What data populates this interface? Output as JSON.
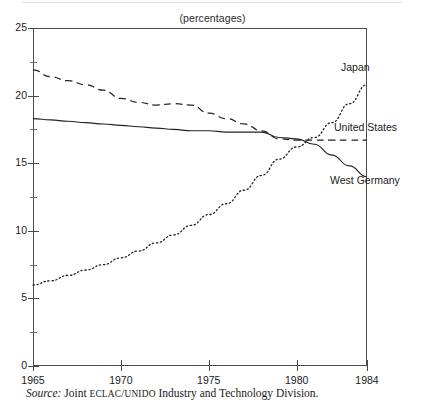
{
  "unit_note": "(percentages)",
  "source": {
    "prefix": "Source:",
    "lead": "Joint",
    "org1": "ECLAC",
    "separator": "/",
    "org2": "UNIDO",
    "tail": "Industry and Technology Division."
  },
  "axes": {
    "y_labels": [
      "25",
      "20",
      "15",
      "10",
      "5",
      "0"
    ],
    "y_values": [
      25,
      20,
      15,
      10,
      5,
      0
    ],
    "y_minor_values": [
      22.5,
      17.5,
      12.5,
      7.5,
      2.5
    ],
    "x_labels": [
      "1965",
      "1970",
      "1975",
      "1980",
      "1984"
    ],
    "x_values": [
      1965,
      1970,
      1975,
      1980,
      1984
    ]
  },
  "series_labels": {
    "japan": "Japan",
    "united_states": "United States",
    "west_germany": "West Germany"
  },
  "colors": {
    "ink": "#1a1a1a",
    "axis": "#4a4a4a",
    "line": "#222222"
  },
  "chart_data": {
    "type": "line",
    "title": "",
    "subtitle": "(percentages)",
    "xlabel": "",
    "ylabel": "",
    "xlim": [
      1965,
      1984
    ],
    "ylim": [
      0,
      25
    ],
    "yticks": [
      0,
      5,
      10,
      15,
      20,
      25
    ],
    "xticks": [
      1965,
      1970,
      1975,
      1980,
      1984
    ],
    "grid": false,
    "legend_position": "inline-right-labels",
    "annotations": [
      "Japan",
      "United States",
      "West Germany"
    ],
    "series": [
      {
        "name": "Japan",
        "style": "dotted",
        "x": [
          1965,
          1966,
          1967,
          1968,
          1969,
          1970,
          1971,
          1972,
          1973,
          1974,
          1975,
          1976,
          1977,
          1978,
          1979,
          1980,
          1981,
          1982,
          1983,
          1984
        ],
        "values": [
          6.0,
          6.3,
          6.7,
          7.1,
          7.5,
          8.0,
          8.5,
          9.1,
          9.7,
          10.4,
          11.2,
          12.0,
          13.0,
          14.1,
          15.3,
          16.2,
          16.9,
          18.0,
          19.4,
          20.8
        ]
      },
      {
        "name": "United States",
        "style": "dashed",
        "x": [
          1965,
          1966,
          1967,
          1968,
          1969,
          1970,
          1971,
          1972,
          1973,
          1974,
          1975,
          1976,
          1977,
          1978,
          1979,
          1980,
          1981,
          1982,
          1983,
          1984
        ],
        "values": [
          21.9,
          21.4,
          21.1,
          20.8,
          20.4,
          19.8,
          19.5,
          19.3,
          19.4,
          19.3,
          18.7,
          18.3,
          17.9,
          17.4,
          16.8,
          16.7,
          16.7,
          16.7,
          16.7,
          16.7
        ]
      },
      {
        "name": "West Germany",
        "style": "solid",
        "x": [
          1965,
          1966,
          1967,
          1968,
          1969,
          1970,
          1971,
          1972,
          1973,
          1974,
          1975,
          1976,
          1977,
          1978,
          1979,
          1980,
          1981,
          1982,
          1983,
          1984
        ],
        "values": [
          18.3,
          18.2,
          18.1,
          18.0,
          17.9,
          17.8,
          17.7,
          17.6,
          17.5,
          17.4,
          17.4,
          17.3,
          17.3,
          17.3,
          16.9,
          16.8,
          16.4,
          15.6,
          14.8,
          14.0
        ]
      }
    ]
  }
}
